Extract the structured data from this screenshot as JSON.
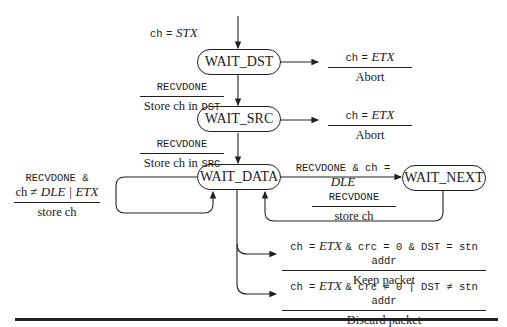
{
  "diagram": {
    "type": "state-machine",
    "entry_label": {
      "var": "ch",
      "op": "=",
      "value": "STX"
    },
    "states": [
      {
        "id": "wait_dst",
        "label": "WAIT_DST"
      },
      {
        "id": "wait_src",
        "label": "WAIT_SRC"
      },
      {
        "id": "wait_data",
        "label": "WAIT_DATA"
      },
      {
        "id": "wait_next",
        "label": "WAIT_NEXT"
      }
    ],
    "transitions": {
      "dst_abort": {
        "cond_var": "ch",
        "cond_op": "=",
        "cond_val": "ETX",
        "action": "Abort"
      },
      "dst_to_src": {
        "cond": "RECVDONE",
        "action_pre": "Store ch in",
        "action_reg": "DST"
      },
      "src_abort": {
        "cond_var": "ch",
        "cond_op": "=",
        "cond_val": "ETX",
        "action": "Abort"
      },
      "src_to_data": {
        "cond": "RECVDONE",
        "action_pre": "Store ch in",
        "action_reg": "SRC"
      },
      "data_self": {
        "cond_line1": "RECVDONE &",
        "cond_pre": "ch ≠",
        "cond_val": "DLE | ETX",
        "action": "store ch"
      },
      "data_to_next": {
        "cond_pre": "RECVDONE & ch =",
        "cond_val": "DLE"
      },
      "next_to_data": {
        "cond": "RECVDONE",
        "action": "store ch"
      },
      "keep": {
        "cond_pre": "ch =",
        "cond_val": "ETX",
        "cond_post": "& crc = 0 & DST = stn addr",
        "action": "Keep packet"
      },
      "discard": {
        "cond_pre": "ch =",
        "cond_val": "ETX",
        "cond_post": "& crc ≠ 0 | DST ≠ stn addr",
        "action": "Discard packet"
      }
    }
  }
}
